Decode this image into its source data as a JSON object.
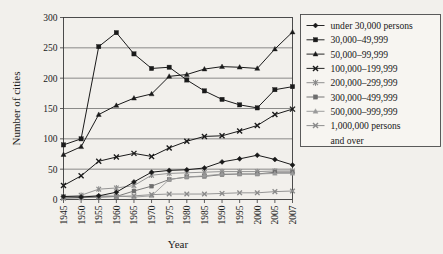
{
  "chart_data": {
    "type": "line",
    "title": "",
    "xlabel": "Year",
    "ylabel": "Number of cities",
    "x": [
      1945,
      1950,
      1955,
      1960,
      1965,
      1970,
      1975,
      1980,
      1985,
      1990,
      1995,
      2000,
      2005,
      2007
    ],
    "xtick_labels": [
      "1945",
      "1950",
      "1955",
      "1960",
      "1965",
      "1970",
      "1975",
      "1980",
      "1985",
      "1990",
      "1995",
      "2000",
      "2005",
      "2007"
    ],
    "ytick_labels": [
      "0",
      "50",
      "100",
      "150",
      "200",
      "250",
      "300"
    ],
    "yticks": [
      0,
      50,
      100,
      150,
      200,
      250,
      300
    ],
    "ylim": [
      0,
      300
    ],
    "grid": "horizontal",
    "legend_position": "right",
    "series": [
      {
        "name": "under 30,000 persons",
        "marker": "diamond",
        "color": "#1a1a1a",
        "values": [
          5,
          4,
          6,
          12,
          29,
          45,
          48,
          49,
          52,
          62,
          67,
          73,
          66,
          57
        ]
      },
      {
        "name": "30,000–49,999",
        "marker": "square",
        "color": "#1a1a1a",
        "values": [
          90,
          100,
          252,
          275,
          240,
          216,
          218,
          197,
          179,
          165,
          156,
          151,
          181,
          186
        ]
      },
      {
        "name": "50,000–99,999",
        "marker": "triangle",
        "color": "#1a1a1a",
        "values": [
          74,
          87,
          140,
          155,
          167,
          174,
          203,
          206,
          215,
          219,
          218,
          216,
          248,
          276
        ]
      },
      {
        "name": "100,000–199,999",
        "marker": "x",
        "color": "#1a1a1a",
        "values": [
          23,
          39,
          63,
          70,
          76,
          71,
          85,
          96,
          104,
          105,
          113,
          122,
          140,
          149
        ]
      },
      {
        "name": "200,000–299,999",
        "marker": "asterisk",
        "color": "#8a8a8a",
        "values": [
          5,
          7,
          17,
          19,
          23,
          40,
          43,
          44,
          45,
          46,
          46,
          46,
          47,
          47
        ]
      },
      {
        "name": "300,000–499,999",
        "marker": "square",
        "color": "#6e6e6e",
        "values": [
          3,
          3,
          4,
          5,
          14,
          22,
          33,
          37,
          38,
          41,
          42,
          42,
          45,
          45
        ]
      },
      {
        "name": "500,000–999,999",
        "marker": "triangle",
        "color": "#9a9a9a",
        "values": [
          5,
          5,
          6,
          6,
          4,
          6,
          33,
          37,
          39,
          42,
          42,
          42,
          43,
          43
        ]
      },
      {
        "name": "1,000,000 persons and over",
        "marker": "x",
        "color": "#8a8a8a",
        "values": [
          2,
          3,
          4,
          5,
          6,
          8,
          9,
          9,
          9,
          10,
          11,
          11,
          13,
          14
        ]
      }
    ]
  },
  "legend": {
    "entries": [
      {
        "label": "under 30,000 persons"
      },
      {
        "label": "30,000–49,999"
      },
      {
        "label": "50,000–99,999"
      },
      {
        "label": "100,000–199,999"
      },
      {
        "label": "200,000–299,999"
      },
      {
        "label": "300,000–499,999"
      },
      {
        "label": "500,000–999,999"
      },
      {
        "label": "1,000,000 persons"
      },
      {
        "label": "and over"
      }
    ]
  },
  "colors": {
    "background": "#f2f0ec",
    "axis": "#3a3a3a",
    "grid": "#5d5d5d",
    "ink": "#1a1a1a"
  }
}
